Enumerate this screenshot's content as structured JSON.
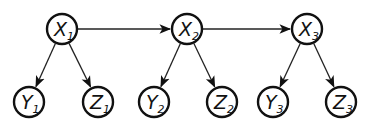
{
  "diagram": {
    "type": "graphical-model",
    "nodes": [
      {
        "id": "X1",
        "label": "X",
        "subscript": "1",
        "cx": 62,
        "cy": 29
      },
      {
        "id": "X2",
        "label": "X",
        "subscript": "2",
        "cx": 187,
        "cy": 29
      },
      {
        "id": "X3",
        "label": "X",
        "subscript": "3",
        "cx": 307,
        "cy": 29
      },
      {
        "id": "Y1",
        "label": "Y",
        "subscript": "1",
        "cx": 29,
        "cy": 102
      },
      {
        "id": "Z1",
        "label": "Z",
        "subscript": "1",
        "cx": 98,
        "cy": 102
      },
      {
        "id": "Y2",
        "label": "Y",
        "subscript": "2",
        "cx": 154,
        "cy": 102
      },
      {
        "id": "Z2",
        "label": "Z",
        "subscript": "2",
        "cx": 222,
        "cy": 102
      },
      {
        "id": "Y3",
        "label": "Y",
        "subscript": "3",
        "cx": 273,
        "cy": 102
      },
      {
        "id": "Z3",
        "label": "Z",
        "subscript": "3",
        "cx": 341,
        "cy": 102
      }
    ],
    "edges": [
      {
        "from": "X1",
        "to": "X2"
      },
      {
        "from": "X2",
        "to": "X3"
      },
      {
        "from": "X1",
        "to": "Y1"
      },
      {
        "from": "X1",
        "to": "Z1"
      },
      {
        "from": "X2",
        "to": "Y2"
      },
      {
        "from": "X2",
        "to": "Z2"
      },
      {
        "from": "X3",
        "to": "Y3"
      },
      {
        "from": "X3",
        "to": "Z3"
      }
    ],
    "node_radius": 15,
    "colors": {
      "stroke": "#111111",
      "edge": "#222222",
      "background": "#ffffff"
    }
  }
}
